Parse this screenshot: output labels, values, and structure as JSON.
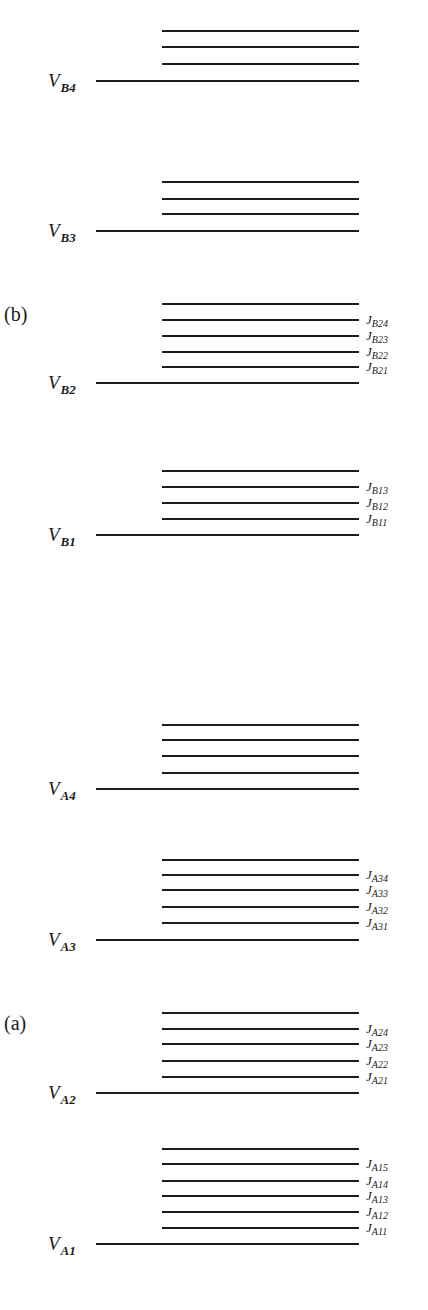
{
  "diagram": {
    "panel_labels": [
      {
        "text": "(b)",
        "x": 4,
        "y": 304
      },
      {
        "text": "(a)",
        "x": 4,
        "y": 1013
      }
    ],
    "line_geometry": {
      "base_x_start": 96,
      "sub_x_start": 162,
      "x_end": 359
    },
    "groups": [
      {
        "panel": "b",
        "base_label": {
          "main": "V",
          "sub": "B4"
        },
        "base_y": 81,
        "sublevels_y": [
          64,
          47,
          31
        ],
        "j_labels": []
      },
      {
        "panel": "b",
        "base_label": {
          "main": "V",
          "sub": "B3"
        },
        "base_y": 231,
        "sublevels_y": [
          214,
          199,
          182
        ],
        "j_labels": []
      },
      {
        "panel": "b",
        "base_label": {
          "main": "V",
          "sub": "B2"
        },
        "base_y": 383,
        "sublevels_y": [
          367,
          352,
          336,
          320,
          304
        ],
        "j_labels": [
          {
            "main": "J",
            "sub": "B21"
          },
          {
            "main": "J",
            "sub": "B22"
          },
          {
            "main": "J",
            "sub": "B23"
          },
          {
            "main": "J",
            "sub": "B24"
          }
        ]
      },
      {
        "panel": "b",
        "base_label": {
          "main": "V",
          "sub": "B1"
        },
        "base_y": 535,
        "sublevels_y": [
          519,
          503,
          487,
          471
        ],
        "j_labels": [
          {
            "main": "J",
            "sub": "B11"
          },
          {
            "main": "J",
            "sub": "B12"
          },
          {
            "main": "J",
            "sub": "B13"
          }
        ]
      },
      {
        "panel": "a",
        "base_label": {
          "main": "V",
          "sub": "A4"
        },
        "base_y": 789,
        "sublevels_y": [
          773,
          756,
          740,
          725
        ],
        "j_labels": []
      },
      {
        "panel": "a",
        "base_label": {
          "main": "V",
          "sub": "A3"
        },
        "base_y": 940,
        "sublevels_y": [
          923,
          907,
          890,
          875,
          860
        ],
        "j_labels": [
          {
            "main": "J",
            "sub": "A31"
          },
          {
            "main": "J",
            "sub": "A32"
          },
          {
            "main": "J",
            "sub": "A33"
          },
          {
            "main": "J",
            "sub": "A34"
          }
        ]
      },
      {
        "panel": "a",
        "base_label": {
          "main": "V",
          "sub": "A2"
        },
        "base_y": 1093,
        "sublevels_y": [
          1077,
          1061,
          1044,
          1029,
          1013
        ],
        "j_labels": [
          {
            "main": "J",
            "sub": "A21"
          },
          {
            "main": "J",
            "sub": "A22"
          },
          {
            "main": "J",
            "sub": "A23"
          },
          {
            "main": "J",
            "sub": "A24"
          }
        ]
      },
      {
        "panel": "a",
        "base_label": {
          "main": "V",
          "sub": "A1"
        },
        "base_y": 1244,
        "sublevels_y": [
          1228,
          1212,
          1196,
          1181,
          1164,
          1149
        ],
        "j_labels": [
          {
            "main": "J",
            "sub": "A11"
          },
          {
            "main": "J",
            "sub": "A12"
          },
          {
            "main": "J",
            "sub": "A13"
          },
          {
            "main": "J",
            "sub": "A14"
          },
          {
            "main": "J",
            "sub": "A15"
          }
        ]
      }
    ]
  }
}
